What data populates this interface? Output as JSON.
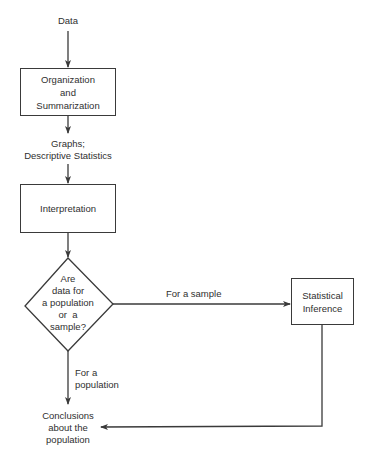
{
  "diagram": {
    "type": "flowchart",
    "line_color": "#3a3a3a",
    "text_color": "#2f2f2f",
    "background": "#ffffff",
    "start_label": "Data",
    "nodes": {
      "organization": {
        "shape": "rectangle",
        "lines": [
          "Organization",
          "and",
          "Summarization"
        ]
      },
      "graphs_output": {
        "shape": "text",
        "lines": [
          "Graphs;",
          "Descriptive Statistics"
        ]
      },
      "interpretation": {
        "shape": "rectangle",
        "lines": [
          "Interpretation"
        ]
      },
      "decision": {
        "shape": "diamond",
        "lines": [
          "Are",
          "data for",
          "a population",
          "or  a",
          "sample?"
        ]
      },
      "statistical_inference": {
        "shape": "rectangle",
        "lines": [
          "Statistical",
          "Inference"
        ]
      },
      "conclusions": {
        "shape": "text",
        "lines": [
          "Conclusions",
          "about the",
          "population"
        ]
      }
    },
    "edges": {
      "sample_branch": {
        "from": "decision",
        "to": "statistical_inference",
        "label": "For a sample"
      },
      "population_branch": {
        "from": "decision",
        "to": "conclusions",
        "label_lines": [
          "For a",
          "population"
        ]
      },
      "inference_to_conclusions": {
        "from": "statistical_inference",
        "to": "conclusions",
        "label": ""
      }
    }
  }
}
